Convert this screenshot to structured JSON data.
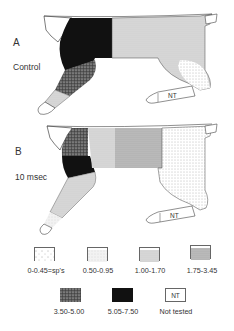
{
  "panels": [
    {
      "label": "A",
      "condition": "Control",
      "regions": {
        "head_forequarter": "0-0.45=sp's",
        "shoulder_upper_foreleg": "5.05-7.50",
        "forearm": "3.50-5.00",
        "forepaw_upper": "1.00-1.70",
        "forepaw_tip": "0-0.45=sp's",
        "trunk": "1.00-1.70",
        "hindquarter": "0.50-0.95",
        "hindleg": "Not tested"
      },
      "hindleg_tag": "NT"
    },
    {
      "label": "B",
      "condition": "10 msec",
      "regions": {
        "head_forequarter": "0-0.45=sp's",
        "shoulder_top": "3.50-5.00",
        "shoulder_lower": "5.05-7.50",
        "anterior_trunk": "1.00-1.70",
        "mid_trunk": "1.75-3.45",
        "forearm": "1.00-1.70",
        "forepaw": "0.50-0.95",
        "hindquarter": "0-0.45=sp's",
        "hindleg": "Not tested"
      },
      "hindleg_tag": "NT"
    }
  ],
  "legend": {
    "items": [
      {
        "label": "0-0.45=sp's",
        "pattern": "sparse-dots"
      },
      {
        "label": "0.50-0.95",
        "pattern": "very-light-stipple"
      },
      {
        "label": "1.00-1.70",
        "pattern": "light-stipple"
      },
      {
        "label": "1.75-3.45",
        "pattern": "medium-stipple"
      },
      {
        "label": "3.50-5.00",
        "pattern": "dark-mottled"
      },
      {
        "label": "5.05-7.50",
        "pattern": "solid-black"
      },
      {
        "label": "Not tested",
        "pattern": "blank",
        "tag": "NT"
      }
    ]
  }
}
